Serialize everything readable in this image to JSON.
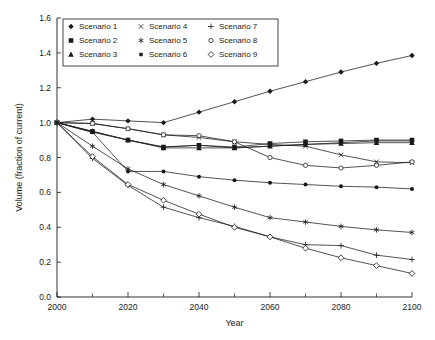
{
  "chart_data": {
    "type": "line",
    "title": "",
    "xlabel": "Year",
    "ylabel": "Volume (fraction of current)",
    "xlim": [
      2000,
      2100
    ],
    "ylim": [
      0.0,
      1.6
    ],
    "x_ticks": [
      2000,
      2020,
      2040,
      2060,
      2080,
      2100
    ],
    "x_tick_labels": [
      "2000",
      "2020",
      "2040",
      "2060",
      "2080",
      "2100"
    ],
    "x_minor_ticks": [
      2010,
      2030,
      2050,
      2070,
      2090
    ],
    "y_ticks": [
      0.0,
      0.2,
      0.4,
      0.6,
      0.8,
      1.0,
      1.2,
      1.4,
      1.6
    ],
    "y_tick_labels": [
      "0.0",
      "0.2",
      "0.4",
      "0.6",
      "0.8",
      "1.0",
      "1.2",
      "1.4",
      "1.6"
    ],
    "grid": false,
    "legend_position": "top-center-inside",
    "line_color": "#1a1a1a",
    "background_color": "#ffffff",
    "x": [
      2000,
      2010,
      2020,
      2030,
      2040,
      2050,
      2060,
      2070,
      2080,
      2090,
      2100
    ],
    "series": [
      {
        "name": "Scenario 1",
        "marker": "filled-diamond",
        "values": [
          1.0,
          1.02,
          1.01,
          1.0,
          1.06,
          1.12,
          1.18,
          1.235,
          1.29,
          1.34,
          1.385
        ]
      },
      {
        "name": "Scenario 2",
        "marker": "filled-square",
        "values": [
          1.0,
          0.95,
          0.9,
          0.86,
          0.87,
          0.86,
          0.88,
          0.89,
          0.895,
          0.9,
          0.9
        ]
      },
      {
        "name": "Scenario 3",
        "marker": "filled-triangle",
        "values": [
          1.0,
          0.95,
          0.9,
          0.855,
          0.855,
          0.855,
          0.865,
          0.875,
          0.88,
          0.885,
          0.885
        ]
      },
      {
        "name": "Scenario 4",
        "marker": "cross-x",
        "values": [
          1.0,
          0.995,
          0.965,
          0.93,
          0.915,
          0.89,
          0.875,
          0.865,
          0.815,
          0.775,
          0.77
        ]
      },
      {
        "name": "Scenario 5",
        "marker": "asterisk",
        "values": [
          1.0,
          0.865,
          0.735,
          0.645,
          0.58,
          0.515,
          0.455,
          0.43,
          0.405,
          0.385,
          0.37
        ]
      },
      {
        "name": "Scenario 6",
        "marker": "filled-square-small",
        "values": [
          1.0,
          0.945,
          0.9,
          0.86,
          0.87,
          0.855,
          0.865,
          0.875,
          0.885,
          0.895,
          0.895
        ]
      },
      {
        "name": "Scenario 7",
        "marker": "plus",
        "values": [
          1.0,
          0.795,
          0.64,
          0.515,
          0.455,
          0.405,
          0.345,
          0.3,
          0.295,
          0.24,
          0.215
        ]
      },
      {
        "name": "Scenario 8",
        "marker": "open-circle",
        "values": [
          1.0,
          0.995,
          0.965,
          0.93,
          0.925,
          0.89,
          0.8,
          0.755,
          0.74,
          0.755,
          0.775
        ]
      },
      {
        "name": "Scenario 9",
        "marker": "open-diamond",
        "values": [
          1.0,
          0.805,
          0.645,
          0.555,
          0.475,
          0.4,
          0.345,
          0.28,
          0.225,
          0.18,
          0.135
        ]
      }
    ],
    "scenario6_extra": {
      "name": "Scenario 6 lower branch",
      "marker": "filled-circle",
      "values": [
        1.0,
        0.945,
        0.72,
        0.72,
        0.69,
        0.67,
        0.655,
        0.645,
        0.635,
        0.63,
        0.62
      ]
    },
    "legend_columns": [
      [
        "Scenario 1",
        "Scenario 2",
        "Scenario 3"
      ],
      [
        "Scenario 4",
        "Scenario 5",
        "Scenario 6"
      ],
      [
        "Scenario 7",
        "Scenario 8",
        "Scenario 9"
      ]
    ]
  }
}
